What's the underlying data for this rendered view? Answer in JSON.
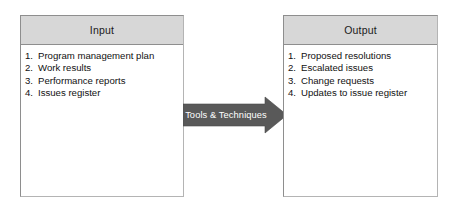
{
  "diagram": {
    "colors": {
      "box_border": "#8e8e8e",
      "header_fill": "#d7d7d7",
      "box_fill": "#ffffff",
      "arrow_fill": "#595959",
      "arrow_label_color": "#ffffff",
      "text_color": "#111111"
    },
    "input_box": {
      "header": "Input",
      "items": [
        {
          "num": "1.",
          "text": "Program management plan"
        },
        {
          "num": "2.",
          "text": "Work results"
        },
        {
          "num": "3.",
          "text": "Performance reports"
        },
        {
          "num": "4.",
          "text": "Issues register"
        }
      ]
    },
    "arrow": {
      "label": "Tools & Techniques",
      "direction": "right",
      "icon": "right-arrow-icon"
    },
    "output_box": {
      "header": "Output",
      "items": [
        {
          "num": "1.",
          "text": "Proposed resolutions"
        },
        {
          "num": "2.",
          "text": "Escalated issues"
        },
        {
          "num": "3.",
          "text": "Change requests"
        },
        {
          "num": "4.",
          "text": "Updates to issue register"
        }
      ]
    }
  }
}
